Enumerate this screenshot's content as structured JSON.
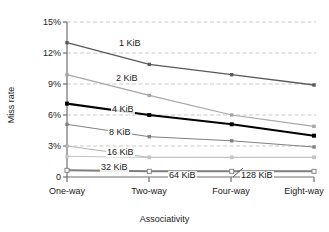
{
  "chart_data": {
    "type": "line",
    "title": "",
    "xlabel": "Associativity",
    "ylabel": "Miss rate",
    "categories": [
      "One-way",
      "Two-way",
      "Four-way",
      "Eight-way"
    ],
    "ylim": [
      0,
      15
    ],
    "ytick_labels": [
      "15%",
      "12%",
      "9%",
      "6%",
      "3%",
      "0"
    ],
    "ytick_values": [
      15,
      12,
      9,
      6,
      3,
      0
    ],
    "grid": "horizontal-dashed",
    "legend_position": "inline-labels",
    "series": [
      {
        "name": "1 KiB",
        "values": [
          13.0,
          10.9,
          9.9,
          8.9
        ],
        "color": "#595959",
        "marker": "square",
        "width": 1.3
      },
      {
        "name": "2 KiB",
        "values": [
          9.9,
          7.9,
          6.0,
          4.9
        ],
        "color": "#a6a6a6",
        "marker": "square",
        "width": 1.2
      },
      {
        "name": "4 KiB",
        "values": [
          7.1,
          6.0,
          5.1,
          4.0
        ],
        "color": "#000000",
        "marker": "square",
        "width": 2.1
      },
      {
        "name": "8 KiB",
        "values": [
          5.1,
          3.9,
          3.5,
          2.9
        ],
        "color": "#808080",
        "marker": "square",
        "width": 1.0
      },
      {
        "name": "16 KiB",
        "values": [
          3.0,
          1.9,
          1.9,
          1.9
        ],
        "color": "#b3b3b3",
        "marker": "square",
        "width": 1.0
      },
      {
        "name": "32 KiB",
        "values": [
          2.0,
          1.9,
          1.9,
          1.9
        ],
        "color": "#c4c4c4",
        "marker": "square",
        "width": 1.0
      },
      {
        "name": "64 KiB",
        "values": [
          0.65,
          0.55,
          0.55,
          0.55
        ],
        "color": "#9a9a9a",
        "marker": "square-open",
        "width": 1.0
      },
      {
        "name": "128 KiB",
        "values": [
          0.65,
          0.55,
          0.55,
          0.55
        ],
        "color": "#808080",
        "marker": "square-open",
        "width": 2.0
      }
    ],
    "series_labels": [
      {
        "text": "1 KiB",
        "x": 118,
        "y": 39
      },
      {
        "text": "2 KiB",
        "x": 115,
        "y": 74
      },
      {
        "text": "4 KiB",
        "x": 111,
        "y": 105
      },
      {
        "text": "8 KiB",
        "x": 108,
        "y": 128
      },
      {
        "text": "16 KiB",
        "x": 106,
        "y": 148
      },
      {
        "text": "32 KiB",
        "x": 100,
        "y": 163
      },
      {
        "text": "64 KiB",
        "x": 168,
        "y": 171
      },
      {
        "text": "128 KiB",
        "x": 240,
        "y": 171
      }
    ]
  }
}
